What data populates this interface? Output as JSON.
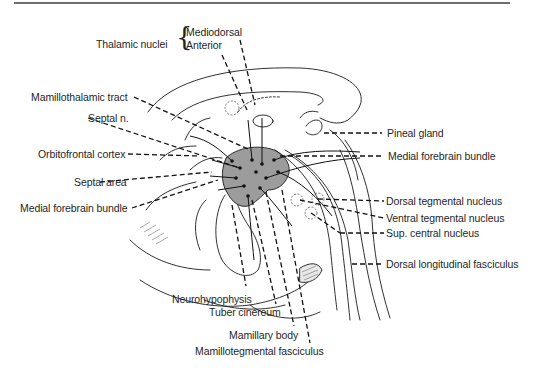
{
  "figure": {
    "shaded_region_color": "#9c9c9c",
    "line_color": "#1a1a1a",
    "text_color": "#1f1f1f"
  },
  "labels": {
    "thalamic_nuclei": "Thalamic nuclei",
    "mediodorsal": "Mediodorsal",
    "anterior": "Anterior",
    "mamillothalamic_tract": "Mamillothalamic tract",
    "septal_n": "Septal n.",
    "orbitofrontal_cortex": "Orbitofrontal cortex",
    "septal_area": "Septal area",
    "medial_forebrain_bundle_left": "Medial forebrain bundle",
    "pineal_gland": "Pineal gland",
    "medial_forebrain_bundle_right": "Medial forebrain bundle",
    "dorsal_tegmental_nucleus": "Dorsal tegmental nucleus",
    "ventral_tegmental_nucleus": "Ventral tegmental nucleus",
    "sup_central_nucleus": "Sup. central nucleus",
    "dorsal_longitudinal_fasciculus": "Dorsal longitudinal fasciculus",
    "neurohypophysis": "Neurohypophysis",
    "tuber_cinereum": "Tuber cinereum",
    "mamillary_body": "Mamillary body",
    "mamillotegmental_fasciculus": "Mamillotegmental fasciculus"
  }
}
